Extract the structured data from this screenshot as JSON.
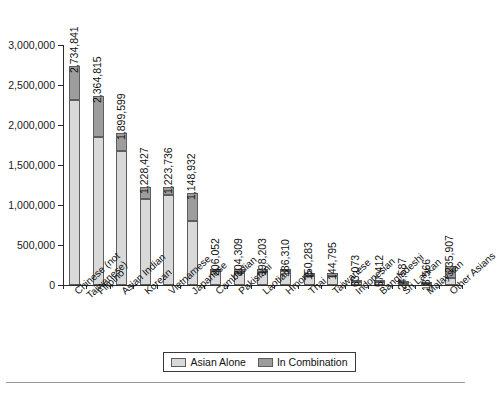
{
  "chart_data": {
    "type": "bar",
    "subtype": "stacked-bar",
    "title": "",
    "subtitle": "",
    "xlabel": "",
    "ylabel": "",
    "ylim": [
      0,
      3000000
    ],
    "ytick_labels": [
      "0",
      "500,000",
      "1,000,000",
      "1,500,000",
      "2,000,000",
      "2,500,000",
      "3,000,000"
    ],
    "ytick_values": [
      0,
      500000,
      1000000,
      1500000,
      2000000,
      2500000,
      3000000
    ],
    "grid": false,
    "legend_position": "bottom",
    "categories": [
      "Chinese (not Taiwanese)",
      "Filipino",
      "Asian Indian",
      "Korean",
      "Vietnamese",
      "Japanese",
      "Cambodian",
      "Pakistani",
      "Laotian",
      "Hmong",
      "Thai",
      "Taiwanese",
      "Indonesian",
      "Bangladeshi",
      "Sri Lankan",
      "Malaysian",
      "Other Asians"
    ],
    "category_lines": [
      [
        "Chinese (not",
        "Taiwanese)"
      ],
      [
        "Filipino"
      ],
      [
        "Asian Indian"
      ],
      [
        "Korean"
      ],
      [
        "Vietnamese"
      ],
      [
        "Japanese"
      ],
      [
        "Cambodian"
      ],
      [
        "Pakistani"
      ],
      [
        "Laotian"
      ],
      [
        "Hmong"
      ],
      [
        "Thai"
      ],
      [
        "Taiwanese"
      ],
      [
        "Indonesian"
      ],
      [
        "Bangladeshi"
      ],
      [
        "Sri Lankan"
      ],
      [
        "Malaysian"
      ],
      [
        "Other Asians"
      ]
    ],
    "series": [
      {
        "name": "Asian Alone",
        "color": "#d9d9d9",
        "values": [
          2314537,
          1850314,
          1678765,
          1076872,
          1122528,
          796700,
          171937,
          153533,
          168707,
          169428,
          112989,
          118048,
          39757,
          41280,
          20145,
          10690,
          85073
        ]
      },
      {
        "name": "In Combination",
        "color": "#9d9d9d",
        "values": [
          420304,
          514501,
          220834,
          151555,
          101208,
          352232,
          34115,
          50776,
          29496,
          16882,
          37294,
          26747,
          23316,
          16132,
          4442,
          7876,
          150834
        ]
      }
    ],
    "totals": [
      2734841,
      2364815,
      1899599,
      1228427,
      1223736,
      1148932,
      206052,
      204309,
      198203,
      186310,
      150283,
      144795,
      63073,
      57412,
      24587,
      18566,
      235907
    ],
    "total_labels": [
      "2,734,841",
      "2,364,815",
      "1,899,599",
      "1,228,427",
      "1,223,736",
      "1,148,932",
      "206,052",
      "204,309",
      "198,203",
      "186,310",
      "150,283",
      "144,795",
      "63,073",
      "57,412",
      "24,587",
      "18,566",
      "235,907"
    ],
    "legend": [
      {
        "label": "Asian Alone",
        "color": "#d9d9d9"
      },
      {
        "label": "In Combination",
        "color": "#9d9d9d"
      }
    ]
  }
}
